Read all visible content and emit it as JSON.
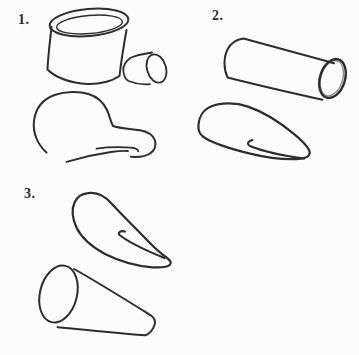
{
  "colors": {
    "paper": "#fcfcfc",
    "ink": "#2d2d2d"
  },
  "steps": [
    {
      "label": "1."
    },
    {
      "label": "2."
    },
    {
      "label": "3."
    }
  ]
}
